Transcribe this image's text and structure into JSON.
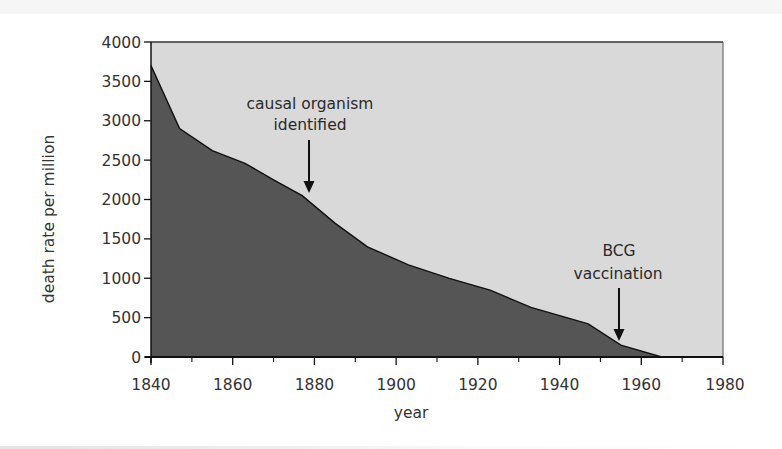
{
  "chart_data": {
    "type": "area",
    "title": "",
    "xlabel": "year",
    "ylabel": "death rate per million",
    "xlim": [
      1840,
      1980
    ],
    "ylim": [
      0,
      4000
    ],
    "grid": false,
    "legend": null,
    "x_ticks": [
      1840,
      1860,
      1880,
      1900,
      1920,
      1940,
      1960,
      1980
    ],
    "x_tick_labels": [
      "1840",
      "1860",
      "1880",
      "1900",
      "1920",
      "1940",
      "1960",
      "1980"
    ],
    "x_minor_ticks": [
      1850,
      1870,
      1890,
      1910,
      1930,
      1950,
      1970
    ],
    "y_ticks": [
      0,
      500,
      1000,
      1500,
      2000,
      2500,
      3000,
      3500,
      4000
    ],
    "y_tick_labels": [
      "0",
      "500",
      "1000",
      "1500",
      "2000",
      "2500",
      "3000",
      "3500",
      "4000"
    ],
    "series": [
      {
        "name": "death rate per million",
        "x": [
          1840,
          1847,
          1855,
          1863,
          1870,
          1877,
          1885,
          1893,
          1903,
          1913,
          1923,
          1933,
          1947,
          1955,
          1965
        ],
        "values": [
          3700,
          2900,
          2620,
          2460,
          2250,
          2050,
          1700,
          1400,
          1170,
          1000,
          850,
          630,
          420,
          150,
          0
        ]
      }
    ],
    "annotations": [
      {
        "lines": [
          "causal organism",
          "identified"
        ],
        "year": 1878,
        "arrow": true
      },
      {
        "lines": [
          "BCG",
          "vaccination"
        ],
        "year": 1954,
        "arrow": true
      }
    ],
    "colors": {
      "area_fill": "#555555",
      "background_fill": "#d9d9d9",
      "line": "#111111",
      "text": "#333333"
    }
  }
}
